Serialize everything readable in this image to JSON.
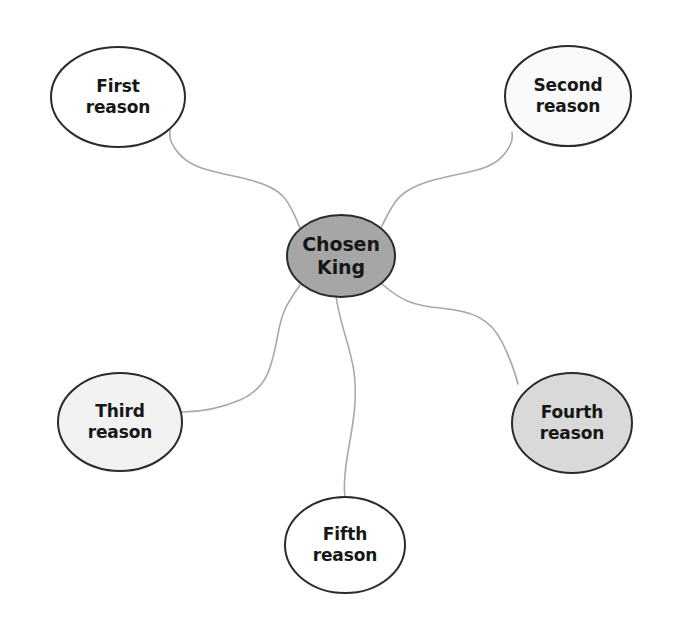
{
  "diagram": {
    "type": "mind-map",
    "canvas": {
      "width": 675,
      "height": 617,
      "background": "#ffffff"
    },
    "center": {
      "id": "chosen-king",
      "line1": "Chosen",
      "line2": "King",
      "fill": "#a6a6a6",
      "stroke": "#2b2b2b",
      "cx": 341,
      "cy": 256,
      "rx": 54,
      "ry": 41,
      "font_size": 19
    },
    "nodes": [
      {
        "id": "first-reason",
        "line1": "First",
        "line2": "reason",
        "fill": "#ffffff",
        "stroke": "#2b2b2b",
        "cx": 118,
        "cy": 97,
        "rx": 67,
        "ry": 50,
        "font_size": 17
      },
      {
        "id": "second-reason",
        "line1": "Second",
        "line2": "reason",
        "fill": "#fafafa",
        "stroke": "#2b2b2b",
        "cx": 568,
        "cy": 96,
        "rx": 63,
        "ry": 50,
        "font_size": 17
      },
      {
        "id": "third-reason",
        "line1": "Third",
        "line2": "reason",
        "fill": "#f2f2f2",
        "stroke": "#2b2b2b",
        "cx": 120,
        "cy": 422,
        "rx": 62,
        "ry": 49,
        "font_size": 17
      },
      {
        "id": "fourth-reason",
        "line1": "Fourth",
        "line2": "reason",
        "fill": "#d9d9d9",
        "stroke": "#2b2b2b",
        "cx": 572,
        "cy": 423,
        "rx": 60,
        "ry": 50,
        "font_size": 17
      },
      {
        "id": "fifth-reason",
        "line1": "Fifth",
        "line2": "reason",
        "fill": "#ffffff",
        "stroke": "#2b2b2b",
        "cx": 345,
        "cy": 545,
        "rx": 60,
        "ry": 48,
        "font_size": 17
      }
    ],
    "connectors": {
      "stroke": "#a8a8a8",
      "stroke_width": 1.6,
      "paths": [
        {
          "id": "link-center-first",
          "from": "chosen-king",
          "to": "first-reason",
          "d": "M 300 228 C 288 198 282 188 250 180 C 214 171 190 170 176 150 C 168 139 170 134 170 130"
        },
        {
          "id": "link-center-second",
          "from": "chosen-king",
          "to": "second-reason",
          "d": "M 381 228 C 394 200 400 190 430 181 C 466 171 492 172 506 152 C 514 141 512 136 512 132"
        },
        {
          "id": "link-center-third",
          "from": "chosen-king",
          "to": "third-reason",
          "d": "M 300 285 C 286 305 282 312 278 334 C 272 366 268 388 240 400 C 214 411 192 412 182 412"
        },
        {
          "id": "link-center-fourth",
          "from": "chosen-king",
          "to": "fourth-reason",
          "d": "M 382 284 C 400 300 414 306 440 308 C 472 311 490 318 502 342 C 512 362 516 376 518 384"
        },
        {
          "id": "link-center-fifth",
          "from": "chosen-king",
          "to": "fifth-reason",
          "d": "M 336 296 C 340 326 350 344 354 372 C 358 402 352 428 348 452 C 344 476 344 490 345 497"
        }
      ]
    }
  }
}
